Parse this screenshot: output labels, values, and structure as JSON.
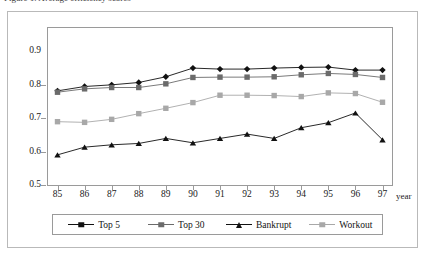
{
  "caption": {
    "text": "Figure 1. Average efficiency scores"
  },
  "axis": {
    "x_title": "year",
    "y_ticks": [
      "0.9",
      "0.8",
      "0.7",
      "0.6",
      "0.5"
    ],
    "x_ticks": [
      "85",
      "86",
      "87",
      "88",
      "89",
      "90",
      "91",
      "92",
      "93",
      "94",
      "95",
      "96",
      "97"
    ]
  },
  "legend": {
    "items": [
      {
        "label": "Top 5",
        "marker": "diamond-marker",
        "color": "#111111"
      },
      {
        "label": "Top 30",
        "marker": "square-marker",
        "color": "#6b6b6b"
      },
      {
        "label": "Bankrupt",
        "marker": "triangle-marker",
        "color": "#111111"
      },
      {
        "label": "Workout",
        "marker": "square-marker",
        "color": "#a8a8a8"
      }
    ]
  },
  "chart_data": {
    "type": "line",
    "title": "",
    "xlabel": "year",
    "ylabel": "",
    "xlim": [
      85,
      97
    ],
    "ylim": [
      0.5,
      0.9
    ],
    "ytick_step": 0.1,
    "grid": false,
    "legend_position": "bottom",
    "x": [
      85,
      86,
      87,
      88,
      89,
      90,
      91,
      92,
      93,
      94,
      95,
      96,
      97
    ],
    "categories": [
      "85",
      "86",
      "87",
      "88",
      "89",
      "90",
      "91",
      "92",
      "93",
      "94",
      "95",
      "96",
      "97"
    ],
    "series": [
      {
        "name": "Top 5",
        "marker": "diamond",
        "color": "#111111",
        "values": [
          0.781,
          0.794,
          0.799,
          0.806,
          0.823,
          0.849,
          0.846,
          0.846,
          0.849,
          0.851,
          0.852,
          0.843,
          0.843
        ]
      },
      {
        "name": "Top 30",
        "marker": "square",
        "color": "#6b6b6b",
        "values": [
          0.777,
          0.787,
          0.791,
          0.791,
          0.802,
          0.821,
          0.822,
          0.822,
          0.823,
          0.829,
          0.833,
          0.83,
          0.821
        ]
      },
      {
        "name": "Bankrupt",
        "marker": "triangle",
        "color": "#111111",
        "values": [
          0.59,
          0.613,
          0.62,
          0.624,
          0.639,
          0.626,
          0.639,
          0.652,
          0.639,
          0.671,
          0.686,
          0.715,
          0.635
        ]
      },
      {
        "name": "Workout",
        "marker": "square",
        "color": "#a8a8a8",
        "values": [
          0.689,
          0.687,
          0.696,
          0.713,
          0.729,
          0.746,
          0.768,
          0.768,
          0.767,
          0.764,
          0.775,
          0.773,
          0.747
        ]
      }
    ]
  }
}
